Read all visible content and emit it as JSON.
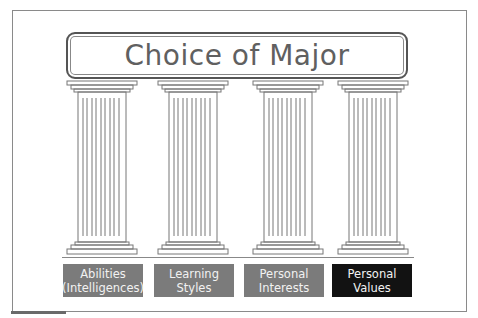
{
  "title": "Choice of Major",
  "colors": {
    "label_gray": "#7b7b7b",
    "label_dark": "#121212",
    "label_text": "#f0f0f0",
    "title_text": "#606060",
    "outline": "#555555"
  },
  "pillars": [
    {
      "line1": "Abilities",
      "line2": "(Intelligences)",
      "style": "gray"
    },
    {
      "line1": "Learning",
      "line2": "Styles",
      "style": "gray"
    },
    {
      "line1": "Personal",
      "line2": "Interests",
      "style": "gray"
    },
    {
      "line1": "Personal",
      "line2": "Values",
      "style": "dark"
    }
  ]
}
